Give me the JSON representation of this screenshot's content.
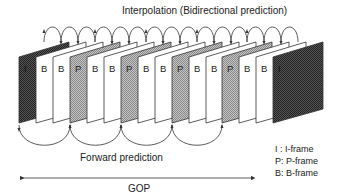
{
  "diagram": {
    "title": "Interpolation (Bidirectional prediction)",
    "forward_label": "Forward prediction",
    "gop_label": "GOP",
    "frames": [
      "I",
      "B",
      "B",
      "P",
      "B",
      "B",
      "P",
      "B",
      "B",
      "P",
      "B",
      "B",
      "P",
      "B",
      "B",
      "I"
    ],
    "frame_x": [
      19,
      36,
      53,
      70,
      87,
      104,
      121,
      138,
      155,
      172,
      189,
      206,
      222,
      239,
      256,
      273
    ],
    "forward_arcs": [
      [
        19,
        70
      ],
      [
        70,
        121
      ],
      [
        121,
        172
      ],
      [
        172,
        222
      ]
    ],
    "legend": [
      {
        "key": "I :",
        "value": "I-frame"
      },
      {
        "key": "P:",
        "value": "P-frame"
      },
      {
        "key": "B:",
        "value": "B-frame"
      }
    ],
    "colors": {
      "line": "#333333",
      "i_frame": "#3a3a3a",
      "p_frame": "#a8a8a8",
      "b_frame": "#ffffff"
    }
  }
}
